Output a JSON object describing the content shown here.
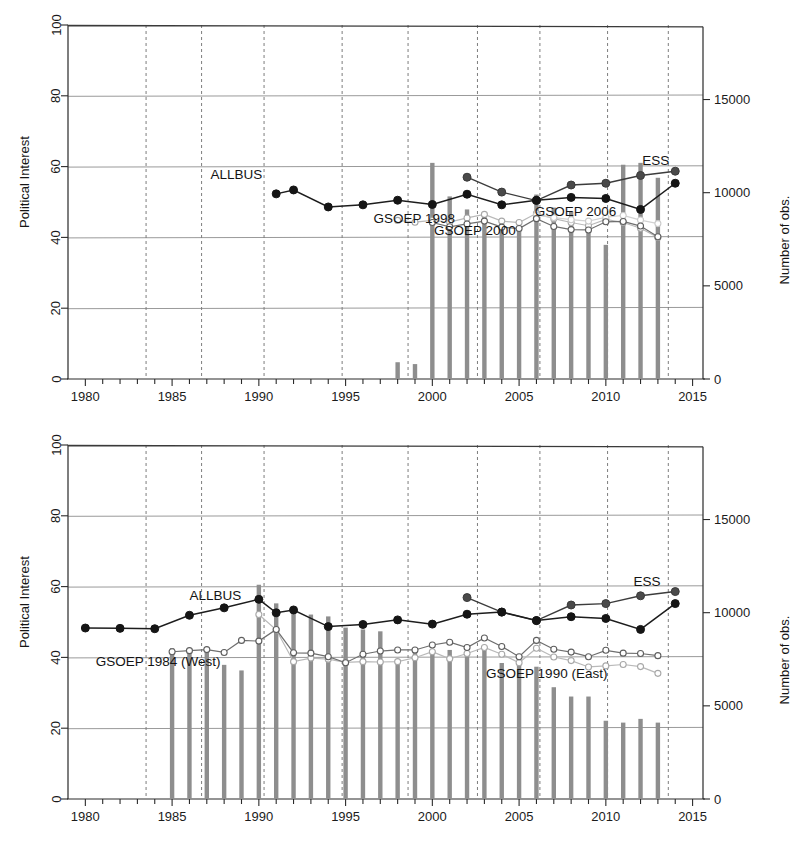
{
  "figure": {
    "width": 800,
    "height": 845,
    "background": "#ffffff",
    "panels": [
      "top",
      "bottom"
    ]
  },
  "axes_common": {
    "x_label_ticks": [
      "1980",
      "1985",
      "1990",
      "1995",
      "2000",
      "2005",
      "2010",
      "2015"
    ],
    "y_left_ticks": [
      "0",
      "20",
      "40",
      "60",
      "80",
      "100"
    ],
    "y_right_ticks": [
      "0",
      "5000",
      "10000",
      "15000"
    ],
    "y_left_title": "Political Interest",
    "y_right_title": "Number of obs.",
    "x_range": [
      1979,
      2015.6
    ],
    "y_left_range": [
      0,
      100
    ],
    "y_right_range": [
      0,
      19000
    ],
    "bar_color": "#8e8e8e",
    "grid_solid_color": "#9a9a9a",
    "grid_dash_color": "#7d7d7d",
    "dashed_vertical_years": [
      1983.5,
      1986.7,
      1990.3,
      1994.8,
      1998.6,
      2002.6,
      2006.2,
      2010.1,
      2013.6
    ]
  },
  "chart_data": [
    {
      "id": "top",
      "type": "line",
      "title": "",
      "xlabel": "",
      "ylabel": "Political Interest",
      "y2label": "Number of obs.",
      "xlim": [
        1979,
        2015.6
      ],
      "ylim": [
        0,
        100
      ],
      "y2lim": [
        0,
        19000
      ],
      "grid": true,
      "legend": "inline-annotations",
      "annotations": [
        {
          "text": "ALLBUS",
          "x": 1990.2,
          "y": 56.5,
          "anchor": "end"
        },
        {
          "text": "GSOEP 1998",
          "x": 1996.6,
          "y": 44.0,
          "anchor": "start"
        },
        {
          "text": "GSOEP 2000",
          "x": 2000.1,
          "y": 40.6,
          "anchor": "start"
        },
        {
          "text": "GSOEP 2006",
          "x": 2005.9,
          "y": 46.2,
          "anchor": "start"
        },
        {
          "text": "ESS",
          "x": 2012.1,
          "y": 60.5,
          "anchor": "start"
        }
      ],
      "series": [
        {
          "name": "ALLBUS",
          "style": "black-filled",
          "x": [
            1991,
            1992,
            1994,
            1996,
            1998,
            2000,
            2002,
            2004,
            2006,
            2008,
            2010,
            2012,
            2014
          ],
          "values": [
            52.3,
            53.4,
            48.6,
            49.2,
            50.5,
            49.3,
            52.2,
            49.2,
            50.5,
            51.3,
            51.0,
            47.9,
            55.3
          ]
        },
        {
          "name": "ESS",
          "style": "dark-gray-filled",
          "x": [
            2002,
            2004,
            2006,
            2008,
            2010,
            2012,
            2014
          ],
          "values": [
            57.0,
            52.8,
            50.4,
            54.8,
            55.3,
            57.5,
            58.7
          ]
        },
        {
          "name": "GSOEP 2000",
          "style": "open-circle-dark",
          "x": [
            2000,
            2001,
            2002,
            2003,
            2004,
            2005,
            2006,
            2007,
            2008,
            2009,
            2010,
            2011,
            2012,
            2013
          ],
          "values": [
            44.2,
            43.0,
            43.8,
            44.6,
            42.9,
            42.5,
            45.3,
            43.1,
            42.2,
            42.1,
            44.4,
            44.5,
            43.2,
            40.2
          ]
        },
        {
          "name": "GSOEP 1998",
          "style": "light-gray-open",
          "x": [
            1998,
            1999,
            2000,
            2001,
            2002,
            2003,
            2004,
            2005,
            2006,
            2007,
            2008,
            2009,
            2010,
            2011,
            2012,
            2013
          ],
          "values": [
            44.8,
            44.3,
            44.8,
            44.3,
            45.5,
            46.5,
            44.6,
            44.2,
            46.8,
            45.3,
            44.2,
            43.3,
            45.1,
            44.2,
            42.6,
            40.0
          ]
        },
        {
          "name": "GSOEP 2006",
          "style": "gray-filled-open",
          "x": [
            2006,
            2007,
            2008,
            2009,
            2010,
            2011,
            2012,
            2013
          ],
          "values": [
            46.3,
            45.6,
            45.0,
            44.6,
            45.7,
            46.2,
            44.9,
            43.9
          ]
        }
      ],
      "bars": {
        "label": "Number of obs.",
        "x": [
          1998,
          1999,
          2000,
          2001,
          2002,
          2003,
          2004,
          2005,
          2006,
          2007,
          2008,
          2009,
          2010,
          2011,
          2012,
          2013
        ],
        "values": [
          900,
          800,
          11600,
          9800,
          9100,
          8700,
          8400,
          8000,
          9900,
          9200,
          9000,
          8100,
          7200,
          11500,
          11600,
          10800
        ]
      }
    },
    {
      "id": "bottom",
      "type": "line",
      "title": "",
      "xlabel": "",
      "ylabel": "Political Interest",
      "y2label": "Number of obs.",
      "xlim": [
        1979,
        2015.6
      ],
      "ylim": [
        0,
        100
      ],
      "y2lim": [
        0,
        19000
      ],
      "grid": true,
      "legend": "inline-annotations",
      "annotations": [
        {
          "text": "ALLBUS",
          "x": 1986.0,
          "y": 56.2,
          "anchor": "start"
        },
        {
          "text": "GSOEP 1984 (West)",
          "x": 1980.6,
          "y": 37.6,
          "anchor": "start"
        },
        {
          "text": "GSOEP 1990 (East)",
          "x": 2003.1,
          "y": 34.3,
          "anchor": "start"
        },
        {
          "text": "ESS",
          "x": 2011.6,
          "y": 60.2,
          "anchor": "start"
        }
      ],
      "series": [
        {
          "name": "ALLBUS",
          "style": "black-filled",
          "x": [
            1980,
            1982,
            1984,
            1986,
            1988,
            1990,
            1991,
            1992,
            1994,
            1996,
            1998,
            2000,
            2002,
            2004,
            2006,
            2008,
            2010,
            2012,
            2014
          ],
          "values": [
            48.3,
            48.2,
            48.1,
            51.9,
            54.0,
            56.4,
            52.6,
            53.4,
            48.7,
            49.3,
            50.6,
            49.4,
            52.2,
            52.8,
            50.4,
            51.5,
            51.0,
            47.9,
            55.2
          ]
        },
        {
          "name": "ESS",
          "style": "dark-gray-filled",
          "x": [
            2002,
            2004,
            2006,
            2008,
            2010,
            2012,
            2014
          ],
          "values": [
            56.9,
            52.8,
            50.4,
            54.8,
            55.2,
            57.4,
            58.6
          ]
        },
        {
          "name": "GSOEP 1984 (West)",
          "style": "open-circle-dark",
          "x": [
            1985,
            1986,
            1987,
            1988,
            1989,
            1990,
            1991,
            1992,
            1993,
            1994,
            1995,
            1996,
            1997,
            1998,
            1999,
            2000,
            2001,
            2002,
            2003,
            2004,
            2005,
            2006,
            2007,
            2008,
            2009,
            2010,
            2011,
            2012,
            2013
          ],
          "values": [
            41.6,
            41.9,
            42.2,
            41.4,
            44.8,
            44.6,
            47.9,
            41.3,
            41.2,
            40.2,
            38.5,
            40.9,
            41.8,
            42.1,
            42.1,
            43.5,
            44.3,
            42.8,
            45.5,
            43.1,
            40.2,
            44.8,
            42.3,
            41.5,
            40.2,
            42.0,
            41.2,
            41.1,
            40.5
          ]
        },
        {
          "name": "GSOEP 1990 (East)",
          "style": "light-gray-open",
          "x": [
            1990,
            1991,
            1992,
            1993,
            1994,
            1995,
            1996,
            1997,
            1998,
            1999,
            2000,
            2001,
            2002,
            2003,
            2004,
            2005,
            2006,
            2007,
            2008,
            2009,
            2010,
            2011,
            2012,
            2013
          ],
          "values": [
            52.1,
            47.8,
            38.8,
            39.8,
            39.5,
            38.6,
            38.8,
            38.7,
            38.8,
            39.9,
            41.6,
            39.6,
            41.1,
            42.8,
            40.9,
            38.5,
            42.6,
            40.1,
            39.1,
            37.3,
            37.6,
            38.0,
            37.4,
            35.5
          ]
        }
      ],
      "bars": {
        "label": "Number of obs.",
        "x": [
          1985,
          1986,
          1987,
          1988,
          1989,
          1990,
          1991,
          1992,
          1993,
          1994,
          1995,
          1996,
          1997,
          1998,
          1999,
          2000,
          2001,
          2002,
          2003,
          2004,
          2005,
          2006,
          2007,
          2008,
          2009,
          2010,
          2011,
          2012,
          2013
        ],
        "values": [
          8100,
          8000,
          8100,
          7200,
          6900,
          11500,
          10500,
          10000,
          9900,
          9800,
          9200,
          9100,
          9000,
          7500,
          8100,
          8000,
          8000,
          7900,
          8000,
          7300,
          7200,
          7100,
          6000,
          5500,
          5500,
          4200,
          4100,
          4300,
          4100
        ]
      }
    }
  ],
  "labels": {
    "y_left_title": "Political Interest",
    "y_right_title": "Number of obs.",
    "series_allbus": "ALLBUS",
    "series_ess": "ESS",
    "series_gsoep_1998": "GSOEP 1998",
    "series_gsoep_2000": "GSOEP 2000",
    "series_gsoep_2006": "GSOEP 2006",
    "series_gsoep_1984_west": "GSOEP 1984 (West)",
    "series_gsoep_1990_east": "GSOEP 1990 (East)"
  }
}
